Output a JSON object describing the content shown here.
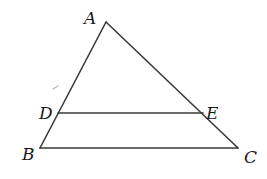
{
  "diagram": {
    "type": "triangle-with-parallel-segment",
    "points": {
      "A": {
        "x": 106,
        "y": 22,
        "label": "A"
      },
      "B": {
        "x": 40,
        "y": 148,
        "label": "B"
      },
      "C": {
        "x": 238,
        "y": 148,
        "label": "C"
      },
      "D": {
        "x": 58,
        "y": 113,
        "label": "D"
      },
      "E": {
        "x": 203,
        "y": 113,
        "label": "E"
      }
    },
    "segments": [
      "AB",
      "AC",
      "BC",
      "DE"
    ],
    "relation": "DE parallel to BC",
    "colors": {
      "line": "#3a3a3a",
      "label": "#1a1a1a",
      "background": "#ffffff"
    }
  }
}
